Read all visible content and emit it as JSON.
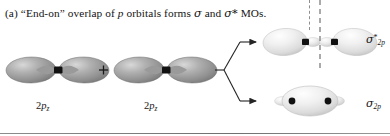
{
  "figure": {
    "panel_letter": "(a)",
    "caption_parts": {
      "lead": "(a) “End-on” overlap of ",
      "italic_p": "p",
      "mid": " orbitals forms ",
      "sigma": "σ",
      "and": " and ",
      "sigma_star": "σ*",
      "tail": " MOs."
    },
    "caption_full": "(a) “End-on” overlap of p orbitals forms σ and σ* MOs.",
    "operator": "+",
    "reactants": [
      {
        "id": "left-orbital",
        "label_main": "2",
        "label_italic": "p",
        "label_sub": "z",
        "label_full": "2pz",
        "type": "p-orbital",
        "lobes": 2
      },
      {
        "id": "right-orbital",
        "label_main": "2",
        "label_italic": "p",
        "label_sub": "z",
        "label_full": "2pz",
        "type": "p-orbital",
        "lobes": 2
      }
    ],
    "products": [
      {
        "id": "antibonding-mo",
        "symbol": "σ",
        "superscript": "*",
        "subscript": "2p",
        "label_full": "σ*2p",
        "name": "antibonding-sigma-star-2p",
        "has_nodal_plane": true,
        "position": "top"
      },
      {
        "id": "bonding-mo",
        "symbol": "σ",
        "superscript": "",
        "subscript": "2p",
        "label_full": "σ2p",
        "name": "bonding-sigma-2p",
        "has_nodal_plane": false,
        "position": "bottom"
      }
    ],
    "colors": {
      "orbital_dark": "#8d8d8d",
      "orbital_mid": "#b4b4b4",
      "orbital_light": "#e9e9e9",
      "orbital_highlight": "#f4f4f4",
      "nucleus": "#111111",
      "arrow": "#242424",
      "nodal_line": "#8e8e8e",
      "baseline": "#7a7a7a",
      "text": "#141414"
    }
  }
}
